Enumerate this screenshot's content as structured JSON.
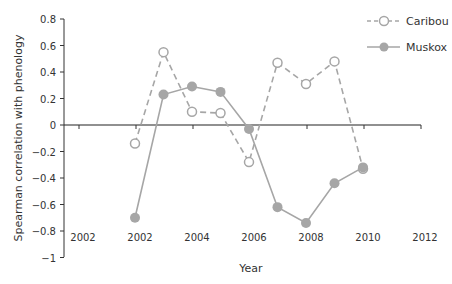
{
  "chart_data": {
    "type": "line",
    "title": "",
    "xlabel": "Year",
    "ylabel": "Spearman correlation with phenology",
    "ylim": [
      -1,
      0.8
    ],
    "yticks": [
      "0.8",
      "0.6",
      "0.4",
      "0.2",
      "0",
      "−0.2",
      "−0.4",
      "−0.6",
      "−0.8",
      "−1"
    ],
    "xtick_labels": [
      "2002",
      "2002",
      "2004",
      "2006",
      "2008",
      "2010",
      "2012"
    ],
    "x": [
      2002,
      2003,
      2004,
      2005,
      2006,
      2007,
      2008,
      2009,
      2010
    ],
    "grid": false,
    "legend_position": "top-right",
    "series": [
      {
        "name": "Caribou",
        "style": "dashed, open circle markers",
        "color": "#a6a6a6",
        "values": [
          -0.14,
          0.55,
          0.1,
          0.09,
          -0.28,
          0.47,
          0.31,
          0.48,
          -0.33
        ]
      },
      {
        "name": "Muskox",
        "style": "solid, filled circle markers",
        "color": "#a6a6a6",
        "values": [
          -0.7,
          0.23,
          0.29,
          0.25,
          -0.03,
          -0.62,
          -0.74,
          -0.44,
          -0.32
        ]
      }
    ]
  }
}
